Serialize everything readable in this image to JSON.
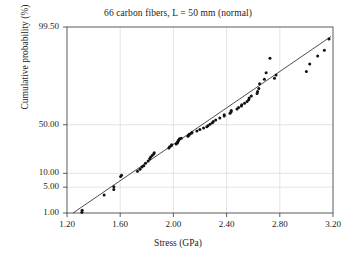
{
  "chart_data": {
    "type": "scatter",
    "title": "66 carbon fibers, L = 50 mm (normal)",
    "xlabel": "Stress (GPa)",
    "ylabel": "Cumulative probability (%)",
    "xlim": [
      1.2,
      3.2
    ],
    "ylim_percent": [
      1.0,
      99.5
    ],
    "y_scale": "normal-probability (probit)",
    "grid": true,
    "legend": "none",
    "n_points": 66,
    "xticks": [
      "1.20",
      "1.60",
      "2.00",
      "2.40",
      "2.80",
      "3.20"
    ],
    "xtick_values": [
      1.2,
      1.6,
      2.0,
      2.4,
      2.8,
      3.2
    ],
    "yticks": [
      "99.50",
      "50.00",
      "10.00",
      "5.00",
      "1.00"
    ],
    "ytick_values": [
      99.5,
      50.0,
      10.0,
      5.0,
      1.0
    ],
    "marker": "filled-circle",
    "marker_color": "#111111",
    "line_color": "#333333",
    "fit_line": {
      "x": [
        1.245,
        3.185
      ],
      "y_percent": [
        1.0,
        99.0
      ]
    },
    "x": [
      1.312,
      1.314,
      1.479,
      1.552,
      1.552,
      1.603,
      1.61,
      1.73,
      1.749,
      1.763,
      1.777,
      1.79,
      1.81,
      1.822,
      1.828,
      1.84,
      1.852,
      1.856,
      1.966,
      1.972,
      1.984,
      1.987,
      2.02,
      2.03,
      2.029,
      2.035,
      2.037,
      2.043,
      2.046,
      2.059,
      2.109,
      2.116,
      2.119,
      2.135,
      2.14,
      2.177,
      2.199,
      2.227,
      2.251,
      2.26,
      2.275,
      2.293,
      2.3,
      2.318,
      2.349,
      2.382,
      2.382,
      2.426,
      2.434,
      2.435,
      2.478,
      2.49,
      2.511,
      2.514,
      2.535,
      2.554,
      2.566,
      2.57,
      2.586,
      2.629,
      2.633,
      2.642,
      2.648,
      2.684,
      2.697,
      2.726
    ],
    "y_percent": [
      1.05,
      1.2,
      3.2,
      4.4,
      5.1,
      8.6,
      9.2,
      11.0,
      12.0,
      13.2,
      14.0,
      15.5,
      17.0,
      18.5,
      19.5,
      20.8,
      22.0,
      23.0,
      27.0,
      28.0,
      29.0,
      29.8,
      30.5,
      31.5,
      32.0,
      33.0,
      34.0,
      34.8,
      35.5,
      36.0,
      38.0,
      39.0,
      40.0,
      41.0,
      42.0,
      43.5,
      45.0,
      46.5,
      48.0,
      49.0,
      50.5,
      52.0,
      53.5,
      55.0,
      57.0,
      59.0,
      60.5,
      62.0,
      63.5,
      64.5,
      66.0,
      67.5,
      69.0,
      70.0,
      71.5,
      73.0,
      74.5,
      76.0,
      77.5,
      79.5,
      81.0,
      83.0,
      86.0,
      88.5,
      91.5,
      96.0
    ],
    "extra_points": {
      "x": [
        2.76,
        2.772,
        3.0,
        3.025,
        3.085,
        3.135,
        3.17
      ],
      "y_percent": [
        89.0,
        90.5,
        92.0,
        94.5,
        96.5,
        97.5,
        98.8
      ]
    }
  }
}
